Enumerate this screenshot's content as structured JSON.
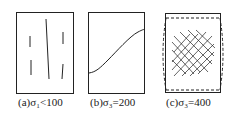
{
  "panels": [
    {
      "id": "a",
      "caption": "(a)σ₁<100",
      "pattern": "sparse vertical cracks"
    },
    {
      "id": "b",
      "caption": "(b)σ₃=200",
      "pattern": "single curved crack"
    },
    {
      "id": "c",
      "caption": "(c)σ₃=400",
      "pattern": "dense crossed cracks with bulging outline"
    }
  ],
  "colors": {
    "line": "#222222",
    "background": "#ffffff"
  }
}
